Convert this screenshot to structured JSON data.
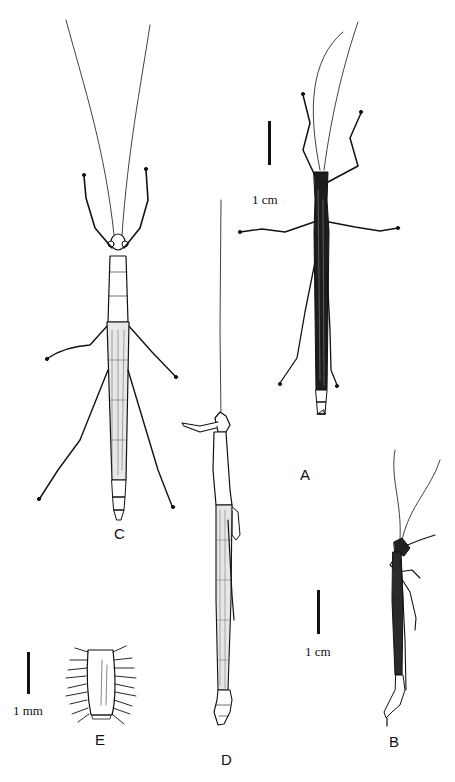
{
  "figure": {
    "panels": [
      {
        "id": "A",
        "label": "A",
        "view": "dorsal, dark-bodied specimen"
      },
      {
        "id": "B",
        "label": "B",
        "view": "lateral, slender specimen"
      },
      {
        "id": "C",
        "label": "C",
        "view": "dorsal, large specimen with long legs"
      },
      {
        "id": "D",
        "label": "D",
        "view": "lateral, elongate specimen"
      },
      {
        "id": "E",
        "label": "E",
        "view": "detail of segment with bristles"
      }
    ],
    "scale_bars": [
      {
        "id": "scale-top",
        "label": "1 cm"
      },
      {
        "id": "scale-bottom-right",
        "label": "1 cm"
      },
      {
        "id": "scale-bottom-left",
        "label": "1 mm"
      }
    ],
    "colors": {
      "ink": "#111111",
      "background": "#ffffff"
    }
  }
}
